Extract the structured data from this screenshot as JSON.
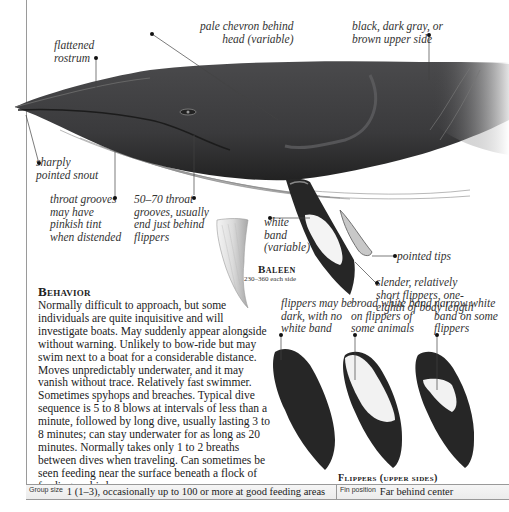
{
  "labels": {
    "flattened_rostrum": "flattened\nrostrum",
    "pale_chevron": "pale chevron behind\nhead (variable)",
    "upper_side": "black, dark gray, or\nbrown upper side",
    "pointed_snout": "sharply\npointed snout",
    "throat_grooves_tint": "throat grooves\nmay have\npinkish tint\nwhen distended",
    "throat_grooves_count": "50–70 throat\ngrooves, usually\nend just behind\nflippers",
    "white_band": "white\nband\n(variable)",
    "pointed_tips": "pointed tips",
    "slender_flippers": "slender, relatively\nshort flippers, one-\neighth of body length"
  },
  "baleen": {
    "title": "Baleen",
    "subtitle": "230–360 each side"
  },
  "behavior": {
    "heading": "Behavior",
    "text": "Normally difficult to approach, but some individuals are quite inquisitive and will investigate boats. May suddenly appear alongside without warning. Unlikely to bow-ride but may swim next to a boat for a considerable distance. Moves unpredictably underwater, and it may vanish without trace. Relatively fast swimmer. Sometimes spyhops and breaches. Typical dive sequence is 5 to 8 blows at intervals of less than a minute, followed by long dive, usually lasting 3 to 8 minutes; can stay underwater for as long as 20 minutes. Normally takes only 1 to 2 breaths between dives when traveling. Can sometimes be seen feeding near the surface beneath a flock of feeding seabirds."
  },
  "flippers": {
    "title": "Flippers (upper sides)",
    "variants": [
      {
        "label": "flippers may be\ndark, with no\nwhite band"
      },
      {
        "label": "broad white band\non flippers of\nsome animals"
      },
      {
        "label": "narrow white\nband on some\nflippers"
      }
    ]
  },
  "footer": {
    "group_size_key": "Group size",
    "group_size_value": "1 (1–3), occasionally up to 100 or more at good feeding areas",
    "fin_position_key": "Fin position",
    "fin_position_value": "Far behind center"
  },
  "colors": {
    "whale_dark": "#3a3a3c",
    "whale_belly": "#ffffff",
    "frame_line": "#9a9a9a",
    "footer_bg": "#f0f0f0"
  }
}
